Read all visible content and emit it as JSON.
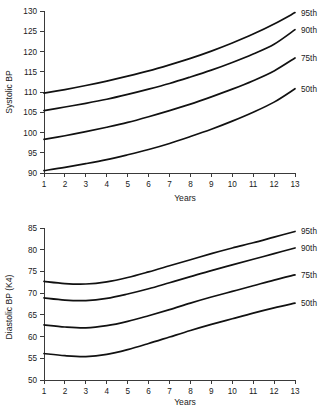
{
  "chart_data": [
    {
      "type": "line",
      "name": "systolic-bp-percentiles",
      "title": "",
      "xlabel": "Years",
      "ylabel": "Systolic BP",
      "xlim": [
        1,
        13
      ],
      "ylim": [
        90,
        130
      ],
      "ytick_step": 5,
      "grid": false,
      "legend_position": "right-inline",
      "x": [
        1,
        2,
        3,
        4,
        5,
        6,
        7,
        8,
        9,
        10,
        11,
        12,
        13
      ],
      "xticks": [
        "1",
        "2",
        "3",
        "4",
        "5",
        "6",
        "7",
        "8",
        "9",
        "10",
        "11",
        "12",
        "13"
      ],
      "yticks": [
        "90",
        "95",
        "100",
        "105",
        "110",
        "115",
        "120",
        "125",
        "130"
      ],
      "series": [
        {
          "name": "95th",
          "label": "95th",
          "values": [
            109.7,
            110.6,
            111.6,
            112.7,
            113.9,
            115.2,
            116.7,
            118.3,
            120.1,
            122.1,
            124.3,
            126.8,
            129.6
          ]
        },
        {
          "name": "90th",
          "label": "90th",
          "values": [
            105.4,
            106.3,
            107.2,
            108.2,
            109.4,
            110.7,
            112.1,
            113.7,
            115.4,
            117.3,
            119.4,
            121.8,
            125.4
          ]
        },
        {
          "name": "75th",
          "label": "75th",
          "values": [
            98.3,
            99.2,
            100.2,
            101.3,
            102.5,
            103.9,
            105.4,
            107.0,
            108.8,
            110.7,
            112.8,
            115.2,
            118.4
          ]
        },
        {
          "name": "50th",
          "label": "50th",
          "values": [
            90.6,
            91.4,
            92.3,
            93.3,
            94.5,
            95.8,
            97.3,
            99.0,
            100.8,
            102.8,
            105.0,
            107.5,
            110.8
          ]
        }
      ]
    },
    {
      "type": "line",
      "name": "diastolic-bp-percentiles",
      "title": "",
      "xlabel": "Years",
      "ylabel": "Diastolic BP (K4)",
      "xlim": [
        1,
        13
      ],
      "ylim": [
        50,
        85
      ],
      "ytick_step": 5,
      "grid": false,
      "legend_position": "right-inline",
      "x": [
        1,
        2,
        3,
        4,
        5,
        6,
        7,
        8,
        9,
        10,
        11,
        12,
        13
      ],
      "xticks": [
        "1",
        "2",
        "3",
        "4",
        "5",
        "6",
        "7",
        "8",
        "9",
        "10",
        "11",
        "12",
        "13"
      ],
      "yticks": [
        "50",
        "55",
        "60",
        "65",
        "70",
        "75",
        "80",
        "85"
      ],
      "series": [
        {
          "name": "95th",
          "label": "95th",
          "values": [
            72.7,
            72.2,
            72.1,
            72.6,
            73.6,
            74.9,
            76.3,
            77.7,
            79.1,
            80.4,
            81.6,
            82.9,
            84.2
          ]
        },
        {
          "name": "90th",
          "label": "90th",
          "values": [
            68.9,
            68.4,
            68.3,
            68.8,
            69.8,
            71.0,
            72.4,
            73.8,
            75.2,
            76.5,
            77.8,
            79.1,
            80.4
          ]
        },
        {
          "name": "75th",
          "label": "75th",
          "values": [
            62.7,
            62.2,
            62.0,
            62.5,
            63.5,
            64.8,
            66.2,
            67.7,
            69.1,
            70.4,
            71.7,
            73.0,
            74.2
          ]
        },
        {
          "name": "50th",
          "label": "50th",
          "values": [
            56.1,
            55.6,
            55.4,
            55.9,
            57.0,
            58.4,
            59.9,
            61.4,
            62.8,
            64.1,
            65.4,
            66.6,
            67.7
          ]
        }
      ]
    }
  ],
  "charts": {
    "systolic": {
      "ylabel": "Systolic BP",
      "xlabel": "Years",
      "yticks": [
        "130",
        "125",
        "120",
        "115",
        "110",
        "105",
        "100",
        "95",
        "90"
      ],
      "xticks": [
        "1",
        "2",
        "3",
        "4",
        "5",
        "6",
        "7",
        "8",
        "9",
        "10",
        "11",
        "12",
        "13"
      ],
      "series_labels": [
        "95th",
        "90th",
        "75th",
        "50th"
      ]
    },
    "diastolic": {
      "ylabel": "Diastolic BP (K4)",
      "xlabel": "Years",
      "yticks": [
        "85",
        "80",
        "75",
        "70",
        "65",
        "60",
        "55",
        "50"
      ],
      "xticks": [
        "1",
        "2",
        "3",
        "4",
        "5",
        "6",
        "7",
        "8",
        "9",
        "10",
        "11",
        "12",
        "13"
      ],
      "series_labels": [
        "95th",
        "90th",
        "75th",
        "50th"
      ]
    }
  },
  "colors": {
    "curve": "#111111",
    "axis": "#3a3a3a",
    "text": "#1a1a1a",
    "background": "#ffffff"
  }
}
